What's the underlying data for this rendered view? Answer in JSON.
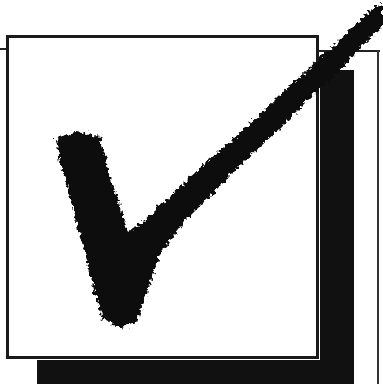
{
  "image": {
    "subject": "checkbox with checkmark",
    "icon": "checkmark-icon",
    "colors": {
      "ink": "#111111",
      "background": "#ffffff",
      "border": "#1a1a1a"
    }
  },
  "label": "Checked box"
}
